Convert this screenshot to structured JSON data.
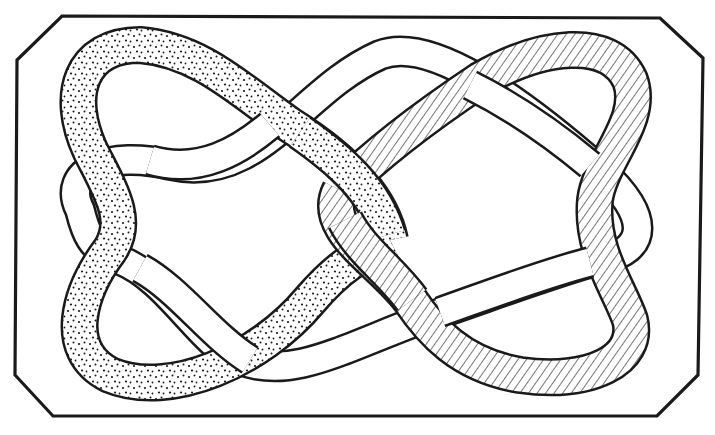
{
  "figure": {
    "colors": {
      "background": "#ffffff",
      "ink": "#1a1a1a"
    },
    "frame": {
      "shape": "octagon-cut-corners",
      "points": [
        [
          62,
          16
        ],
        [
          660,
          18
        ],
        [
          703,
          58
        ],
        [
          698,
          375
        ],
        [
          657,
          416
        ],
        [
          53,
          416
        ],
        [
          15,
          375
        ],
        [
          17,
          60
        ]
      ]
    },
    "bands": [
      {
        "name": "dotted-band",
        "fill_pattern": "stipple"
      },
      {
        "name": "plain-band",
        "fill_pattern": "none"
      },
      {
        "name": "hatched-band",
        "fill_pattern": "hatch"
      }
    ]
  }
}
